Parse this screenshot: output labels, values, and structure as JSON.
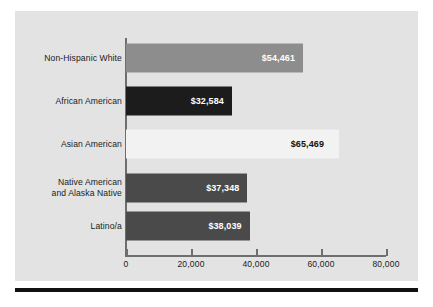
{
  "chart_data": {
    "type": "bar",
    "orientation": "horizontal",
    "title": "",
    "xlabel": "",
    "ylabel": "",
    "categories": [
      "Non-Hispanic White",
      "African American",
      "Asian American",
      "Native American\nand Alaska Native",
      "Latino/a"
    ],
    "values": [
      54461,
      32584,
      65469,
      37348,
      38039
    ],
    "value_labels": [
      "$54,461",
      "$32,584",
      "$65,469",
      "$37,348",
      "$38,039"
    ],
    "bar_colors": [
      "#8d8d8d",
      "#1c1c1c",
      "#f2f2f2",
      "#4a4a4a",
      "#4a4a4a"
    ],
    "label_placement": [
      "inside",
      "inside",
      "outside",
      "inside",
      "inside"
    ],
    "xlim": [
      0,
      80000
    ],
    "xticks": [
      0,
      20000,
      40000,
      60000,
      80000
    ],
    "xtick_labels": [
      "0",
      "20,000",
      "40,000",
      "60,000",
      "80,000"
    ],
    "grid": false,
    "legend": "none",
    "panel_color": "#e3e3e3",
    "axis_color": "#6e6e6e"
  }
}
